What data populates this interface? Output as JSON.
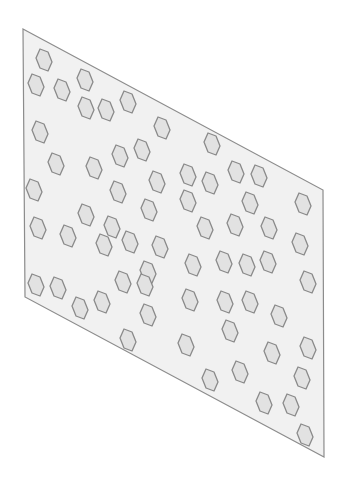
{
  "diagram": {
    "canvas": {
      "width": 348,
      "height": 488,
      "background": "#ffffff"
    },
    "panel": {
      "shape": "parallelogram",
      "corners": [
        [
          23,
          29
        ],
        [
          323,
          190
        ],
        [
          324,
          457
        ],
        [
          25,
          297
        ]
      ],
      "fill": "#f1f1f1",
      "stroke": "#8c8c8c"
    },
    "hexagon_style": {
      "fill": "#e2e2e2",
      "stroke": "#8a8a8a",
      "vertex_offsets": [
        [
          -4,
          -11
        ],
        [
          4,
          -8
        ],
        [
          8,
          2
        ],
        [
          4,
          11
        ],
        [
          -4,
          8
        ],
        [
          -8,
          -2
        ]
      ]
    },
    "hexagons": [
      [
        44,
        60
      ],
      [
        36,
        85
      ],
      [
        62,
        90
      ],
      [
        85,
        80
      ],
      [
        86,
        108
      ],
      [
        106,
        110
      ],
      [
        128,
        102
      ],
      [
        40,
        132
      ],
      [
        56,
        164
      ],
      [
        94,
        168
      ],
      [
        120,
        156
      ],
      [
        142,
        150
      ],
      [
        162,
        128
      ],
      [
        34,
        190
      ],
      [
        118,
        192
      ],
      [
        157,
        182
      ],
      [
        188,
        175
      ],
      [
        212,
        144
      ],
      [
        210,
        183
      ],
      [
        236,
        172
      ],
      [
        259,
        176
      ],
      [
        38,
        228
      ],
      [
        68,
        236
      ],
      [
        86,
        215
      ],
      [
        112,
        227
      ],
      [
        104,
        245
      ],
      [
        130,
        242
      ],
      [
        149,
        210
      ],
      [
        160,
        247
      ],
      [
        188,
        201
      ],
      [
        250,
        203
      ],
      [
        303,
        204
      ],
      [
        205,
        228
      ],
      [
        235,
        225
      ],
      [
        269,
        228
      ],
      [
        300,
        244
      ],
      [
        36,
        285
      ],
      [
        58,
        288
      ],
      [
        80,
        308
      ],
      [
        102,
        302
      ],
      [
        123,
        282
      ],
      [
        148,
        272
      ],
      [
        145,
        285
      ],
      [
        193,
        265
      ],
      [
        224,
        262
      ],
      [
        247,
        265
      ],
      [
        268,
        262
      ],
      [
        308,
        282
      ],
      [
        148,
        315
      ],
      [
        128,
        340
      ],
      [
        190,
        300
      ],
      [
        225,
        302
      ],
      [
        250,
        302
      ],
      [
        279,
        316
      ],
      [
        186,
        345
      ],
      [
        230,
        331
      ],
      [
        272,
        353
      ],
      [
        308,
        348
      ],
      [
        210,
        380
      ],
      [
        240,
        372
      ],
      [
        302,
        378
      ],
      [
        264,
        403
      ],
      [
        291,
        405
      ],
      [
        305,
        435
      ]
    ]
  }
}
